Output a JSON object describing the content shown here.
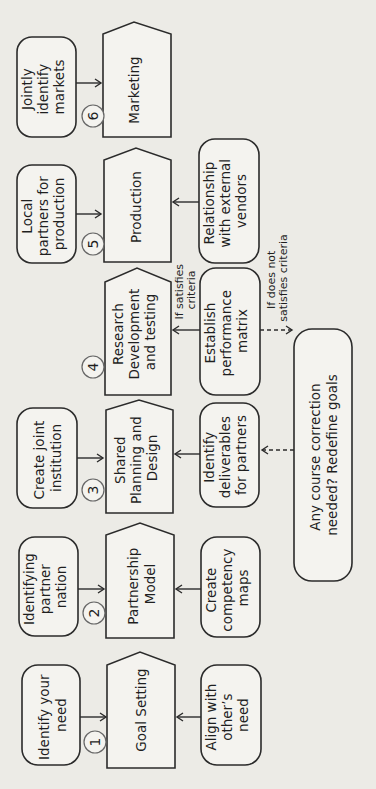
{
  "diagram": {
    "orientation": "rotated-90-ccw",
    "steps": [
      {
        "number": "1",
        "main": [
          "Goal Setting"
        ],
        "input_top": [
          "Identify your",
          "need"
        ],
        "input_bottom": [
          "Align with",
          "other’s",
          "need"
        ]
      },
      {
        "number": "2",
        "main": [
          "Partnership",
          "Model"
        ],
        "input_top": [
          "Identifying",
          "partner",
          "nation"
        ],
        "input_bottom": [
          "Create",
          "competency",
          "maps"
        ]
      },
      {
        "number": "3",
        "main": [
          "Shared",
          "Planning and",
          "Design"
        ],
        "input_top": [
          "Create joint",
          "institution"
        ],
        "input_bottom": [
          "Identify",
          "deliverables",
          "for partners"
        ]
      },
      {
        "number": "4",
        "main": [
          "Research",
          "Development",
          "and testing"
        ],
        "input_bottom": [
          "Establish",
          "performance",
          "matrix"
        ]
      },
      {
        "number": "5",
        "main": [
          "Production"
        ],
        "input_top": [
          "Local",
          "partners for",
          "production"
        ],
        "input_bottom": [
          "Relationship",
          "with external",
          "vendors"
        ]
      },
      {
        "number": "6",
        "main": [
          "Marketing"
        ],
        "input_top": [
          "Jointly",
          "identify",
          "markets"
        ]
      }
    ],
    "feedback": {
      "box": [
        "Any course correction",
        "needed? Redefine goals"
      ],
      "satisfies_label": [
        "If satisfies",
        "criteria"
      ],
      "not_satisfies_label": [
        "If does not",
        "satisfies criteria"
      ]
    },
    "colors": {
      "background": "#ecebe6",
      "shape_fill": "#f4f3ef",
      "stroke": "#2b2b2b"
    }
  }
}
